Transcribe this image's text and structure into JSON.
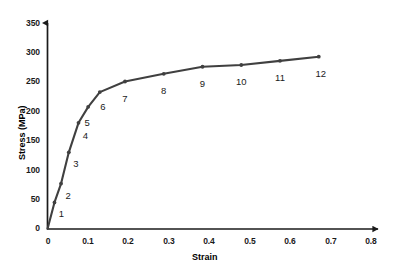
{
  "chart_data": {
    "type": "line",
    "title": "",
    "xlabel": "Strain",
    "ylabel": "Stress (MPa)",
    "xlim": [
      0,
      0.8
    ],
    "ylim": [
      0,
      350
    ],
    "grid": false,
    "legend": null,
    "xticks": [
      "0",
      "0.1",
      "0.2",
      "0.3",
      "0.4",
      "0.5",
      "0.6",
      "0.7",
      "0.8"
    ],
    "xtick_values": [
      0,
      0.1,
      0.2,
      0.3,
      0.4,
      0.5,
      0.6,
      0.7,
      0.8
    ],
    "yticks": [
      "0",
      "50",
      "100",
      "150",
      "200",
      "250",
      "300",
      "350"
    ],
    "ytick_values": [
      0,
      50,
      100,
      150,
      200,
      250,
      300,
      350
    ],
    "series": [
      {
        "name": "stress-strain-curve",
        "color": "#404040",
        "marker": "dot",
        "x": [
          0,
          0.018,
          0.035,
          0.055,
          0.08,
          0.105,
          0.135,
          0.2,
          0.3,
          0.4,
          0.5,
          0.6,
          0.7
        ],
        "y": [
          0,
          45,
          77,
          130,
          180,
          207,
          232,
          250,
          263,
          275,
          278,
          285,
          292
        ]
      }
    ],
    "point_labels": [
      {
        "text": "1",
        "x": 0.018,
        "y": 45
      },
      {
        "text": "2",
        "x": 0.035,
        "y": 77
      },
      {
        "text": "3",
        "x": 0.055,
        "y": 130
      },
      {
        "text": "4",
        "x": 0.08,
        "y": 180
      },
      {
        "text": "5",
        "x": 0.105,
        "y": 207
      },
      {
        "text": "6",
        "x": 0.135,
        "y": 232
      },
      {
        "text": "7",
        "x": 0.2,
        "y": 250
      },
      {
        "text": "8",
        "x": 0.3,
        "y": 263
      },
      {
        "text": "9",
        "x": 0.4,
        "y": 275
      },
      {
        "text": "10",
        "x": 0.5,
        "y": 278
      },
      {
        "text": "11",
        "x": 0.6,
        "y": 285
      },
      {
        "text": "12",
        "x": 0.7,
        "y": 292
      }
    ]
  },
  "axes": {
    "x_title": "Strain",
    "y_title": "Stress (MPa)",
    "x_ticks": [
      "0",
      "0.1",
      "0.2",
      "0.3",
      "0.4",
      "0.5",
      "0.6",
      "0.7",
      "0.8"
    ],
    "y_ticks": [
      "350",
      "300",
      "250",
      "200",
      "150",
      "100",
      "50",
      "0"
    ]
  },
  "point_numbers": [
    "1",
    "2",
    "3",
    "4",
    "5",
    "6",
    "7",
    "8",
    "9",
    "10",
    "11",
    "12"
  ],
  "colors": {
    "curve": "#404040",
    "axis": "#1a1a1a",
    "text": "#1a1a1a",
    "background": "#ffffff"
  }
}
